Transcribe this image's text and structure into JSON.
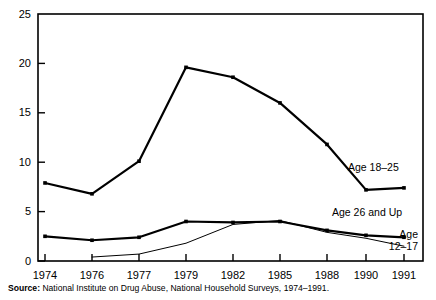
{
  "chart_data": {
    "type": "line",
    "title": "",
    "subtitle": "",
    "xlabel": "",
    "ylabel": "",
    "categories": [
      "1974",
      "1976",
      "1977",
      "1979",
      "1982",
      "1985",
      "1988",
      "1990",
      "1991"
    ],
    "ylim": [
      0,
      25
    ],
    "yticks": [
      0,
      5,
      10,
      15,
      20,
      25
    ],
    "ytick_labels": [
      "0",
      "5",
      "10",
      "15",
      "20",
      "25"
    ],
    "grid": false,
    "legend_position": "inline-right",
    "series": [
      {
        "name": "Age 18–25",
        "values": [
          7.9,
          6.8,
          10.1,
          19.6,
          18.6,
          16.0,
          11.8,
          7.2,
          7.4
        ],
        "color": "#000000",
        "width": 2.2,
        "marker": "square"
      },
      {
        "name": "Age 26 and Up",
        "values": [
          2.5,
          2.1,
          2.4,
          4.0,
          3.9,
          4.0,
          3.1,
          2.6,
          2.4
        ],
        "color": "#000000",
        "width": 2.2,
        "marker": "square"
      },
      {
        "name": "Age 12–17",
        "values": [
          null,
          0.4,
          0.7,
          1.8,
          3.7,
          4.1,
          2.9,
          2.3,
          1.5
        ],
        "color": "#000000",
        "width": 1.0,
        "marker": "none"
      }
    ],
    "annotations": [
      {
        "text": "Age 18–25",
        "x": 1991,
        "y": 10.5
      },
      {
        "text": "Age 26 and Up",
        "x": 1991,
        "y": 4.6
      },
      {
        "text": "Age",
        "x": 1991,
        "y": 2.7
      },
      {
        "text": "12–17",
        "x": 1991,
        "y": 1.5
      }
    ]
  },
  "labels": {
    "series_18_25": "Age 18–25",
    "series_26_up": "Age 26 and Up",
    "series_12_17_line1": "Age",
    "series_12_17_line2": "12–17",
    "y0": "0",
    "y5": "5",
    "y10": "10",
    "y15": "15",
    "y20": "20",
    "y25": "25",
    "x1974": "1974",
    "x1976": "1976",
    "x1977": "1977",
    "x1979": "1979",
    "x1982": "1982",
    "x1985": "1985",
    "x1988": "1988",
    "x1990": "1990",
    "x1991": "1991"
  },
  "source": {
    "prefix": "Source:",
    "text": " National Institute on Drug Abuse, National Household Surveys, 1974–1991."
  }
}
